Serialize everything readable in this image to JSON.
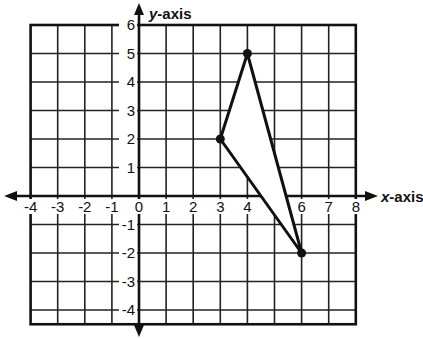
{
  "chart_data": {
    "type": "coordinate-plane",
    "title": "",
    "xlabel": "x-axis",
    "ylabel": "y-axis",
    "x_ticks": [
      "-4",
      "-3",
      "-2",
      "-1",
      "0",
      "1",
      "2",
      "3",
      "4",
      "5",
      "6",
      "7",
      "8"
    ],
    "y_ticks": [
      "6",
      "5",
      "4",
      "3",
      "2",
      "1",
      "-1",
      "-2",
      "-3",
      "-4"
    ],
    "xlim": [
      -4,
      8
    ],
    "ylim": [
      -4.5,
      6
    ],
    "grid": true,
    "shape": "triangle",
    "vertices": [
      {
        "x": 3,
        "y": 2
      },
      {
        "x": 4,
        "y": 5
      },
      {
        "x": 6,
        "y": -2
      }
    ]
  },
  "labels": {
    "x_axis_italic": "x",
    "x_axis_rest": "-axis",
    "y_axis_italic": "y",
    "y_axis_rest": "-axis"
  }
}
